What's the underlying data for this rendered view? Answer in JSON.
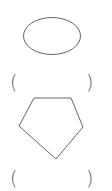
{
  "worksheet": {
    "items": [
      {
        "shape": "ellipse",
        "answer": "",
        "paren_open": "(",
        "paren_close": ")"
      },
      {
        "shape": "pentagon",
        "answer": "",
        "paren_open": "(",
        "paren_close": ")"
      }
    ],
    "stroke_color": "#666666",
    "background_color": "#ffffff"
  }
}
